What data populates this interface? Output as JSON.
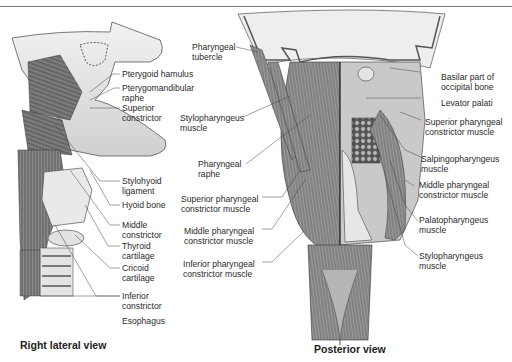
{
  "figure": {
    "views": [
      {
        "id": "right-lateral",
        "caption": "Right lateral view",
        "labels": [
          {
            "lines": [
              "Pterygoid hamulus"
            ]
          },
          {
            "lines": [
              "Pterygomandibular",
              "raphe"
            ]
          },
          {
            "lines": [
              "Superior",
              "constrictor"
            ]
          },
          {
            "lines": [
              "Stylohyoid",
              "ligament"
            ]
          },
          {
            "lines": [
              "Hyoid bone"
            ]
          },
          {
            "lines": [
              "Middle",
              "constrictor"
            ]
          },
          {
            "lines": [
              "Thyroid",
              "cartilage"
            ]
          },
          {
            "lines": [
              "Cricoid",
              "cartilage"
            ]
          },
          {
            "lines": [
              "Inferior",
              "constrictor"
            ]
          },
          {
            "lines": [
              "Esophagus"
            ]
          }
        ]
      },
      {
        "id": "posterior",
        "caption": "Posterior view",
        "left_labels": [
          {
            "lines": [
              "Pharyngeal",
              "tubercle"
            ]
          },
          {
            "lines": [
              "Stylopharyngeus",
              "muscle"
            ]
          },
          {
            "lines": [
              "Pharyngeal",
              "raphe"
            ]
          },
          {
            "lines": [
              "Superior pharyngeal",
              "constrictor muscle"
            ]
          },
          {
            "lines": [
              "Middle pharyngeal",
              "constrictor muscle"
            ]
          },
          {
            "lines": [
              "Inferior pharyngeal",
              "constrictor muscle"
            ]
          }
        ],
        "right_labels": [
          {
            "lines": [
              "Basilar part of",
              "occipital bone"
            ]
          },
          {
            "lines": [
              "Levator palati"
            ]
          },
          {
            "lines": [
              "Superior pharyngeal",
              "constrictor muscle"
            ]
          },
          {
            "lines": [
              "Salpingopharyngeus",
              "muscle"
            ]
          },
          {
            "lines": [
              "Middle pharyngeal",
              "constrictor muscle"
            ]
          },
          {
            "lines": [
              "Palatopharyngeus",
              "muscle"
            ]
          },
          {
            "lines": [
              "Stylopharyngeus",
              "muscle"
            ]
          }
        ]
      }
    ]
  }
}
